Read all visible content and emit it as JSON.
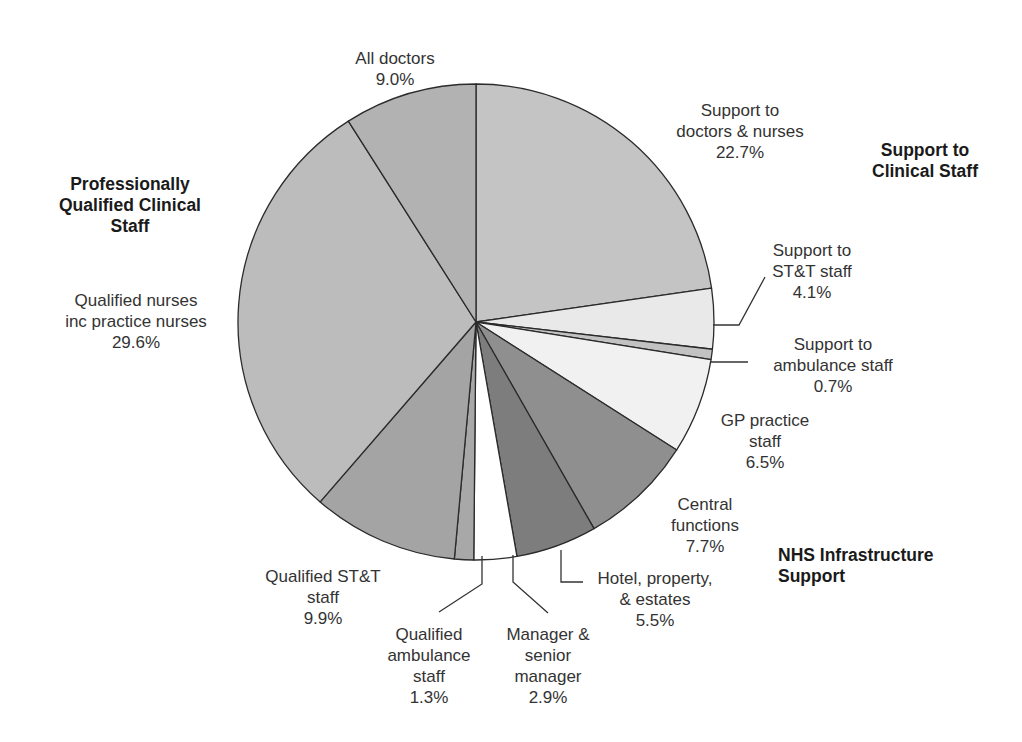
{
  "chart_data": {
    "type": "pie",
    "title": "",
    "start_angle_deg": 0,
    "direction": "clockwise",
    "slices": [
      {
        "label": "Support to doctors & nurses",
        "value": 22.7,
        "display": "22.7%",
        "color": "#c4c4c4",
        "group": "Support to Clinical Staff"
      },
      {
        "label": "Support to ST&T staff",
        "value": 4.1,
        "display": "4.1%",
        "color": "#e9e9e9",
        "group": "Support to Clinical Staff"
      },
      {
        "label": "Support to ambulance staff",
        "value": 0.7,
        "display": "0.7%",
        "color": "#c2c2c2",
        "group": "Support to Clinical Staff"
      },
      {
        "label": "GP practice staff",
        "value": 6.5,
        "display": "6.5%",
        "color": "#f1f1f1",
        "group": "NHS Infrastructure Support"
      },
      {
        "label": "Central functions",
        "value": 7.7,
        "display": "7.7%",
        "color": "#8f8f8f",
        "group": "NHS Infrastructure Support"
      },
      {
        "label": "Hotel, property, & estates",
        "value": 5.5,
        "display": "5.5%",
        "color": "#7d7d7d",
        "group": "NHS Infrastructure Support"
      },
      {
        "label": "Manager & senior manager",
        "value": 2.9,
        "display": "2.9%",
        "color": "#ffffff",
        "group": "NHS Infrastructure Support"
      },
      {
        "label": "Qualified ambulance staff",
        "value": 1.3,
        "display": "1.3%",
        "color": "#a8a8a8",
        "group": "Professionally Qualified Clinical Staff"
      },
      {
        "label": "Qualified ST&T staff",
        "value": 9.9,
        "display": "9.9%",
        "color": "#a4a4a4",
        "group": "Professionally Qualified Clinical Staff"
      },
      {
        "label": "Qualified nurses inc practice nurses",
        "value": 29.6,
        "display": "29.6%",
        "color": "#bcbcbc",
        "group": "Professionally Qualified Clinical Staff"
      },
      {
        "label": "All doctors",
        "value": 9.0,
        "display": "9.0%",
        "color": "#b2b2b2",
        "group": "Professionally Qualified Clinical Staff"
      }
    ],
    "groups": [
      "Professionally Qualified Clinical Staff",
      "Support to Clinical Staff",
      "NHS Infrastructure Support"
    ],
    "legend": "none"
  },
  "labels": {
    "all_doctors": "All doctors\n9.0%",
    "support_doctors_nurses": "Support to\ndoctors & nurses\n22.7%",
    "support_stt": "Support to\nST&T staff\n4.1%",
    "support_ambulance": "Support to\nambulance staff\n0.7%",
    "gp_practice": "GP practice\nstaff\n6.5%",
    "central_functions": "Central\nfunctions\n7.7%",
    "hotel": "Hotel, property,\n& estates\n5.5%",
    "manager": "Manager &\nsenior\nmanager\n2.9%",
    "qualified_ambulance": "Qualified\nambulance\nstaff\n1.3%",
    "qualified_stt": "Qualified ST&T\nstaff\n9.9%",
    "qualified_nurses": "Qualified nurses\ninc practice nurses\n29.6%"
  },
  "groups": {
    "professionally_qualified": "Professionally\nQualified Clinical\nStaff",
    "support_clinical": "Support to\nClinical Staff",
    "nhs_infrastructure": "NHS Infrastructure\nSupport"
  }
}
